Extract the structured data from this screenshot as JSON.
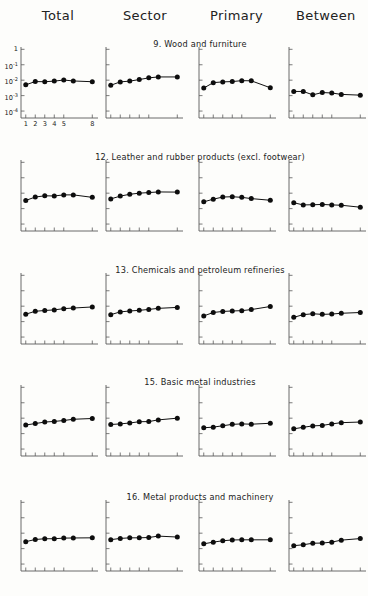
{
  "figure": {
    "background": "#fdfdfb",
    "ink": "#111111",
    "axis_color": "#5a5a5a",
    "columns": [
      {
        "label": "Total",
        "x": 58
      },
      {
        "label": "Sector",
        "x": 145
      },
      {
        "label": "Primary",
        "x": 236
      },
      {
        "label": "Between",
        "x": 322
      }
    ],
    "y_axis": {
      "label_top_to_bottom": [
        "1",
        "10<sup>-1</sup>",
        "10<sup>-2</sup>",
        "10<sup>-3</sup>",
        "10<sup>-4</sup>"
      ],
      "plain": [
        "1",
        "10-1",
        "10-2",
        "10-3",
        "10-4"
      ],
      "min_exp": -4.45,
      "max_exp": 0.15,
      "ticks_exp": [
        0,
        -1,
        -2,
        -3,
        -4
      ]
    },
    "x_axis": {
      "tick_labels": [
        "1",
        "2",
        "3",
        "4",
        "5",
        "8"
      ],
      "tick_positions": [
        1,
        2,
        3,
        4,
        5,
        8
      ],
      "x_min": 0.5,
      "x_max": 8.6,
      "n_points": 7,
      "point_x": [
        1,
        2,
        3,
        4,
        5,
        6,
        8
      ]
    }
  },
  "chart_data": {
    "type": "line",
    "title": "",
    "xlabel": "",
    "ylabel": "",
    "grid": false,
    "legend_position": "none",
    "x_ticks": [
      1,
      2,
      3,
      4,
      5,
      8
    ],
    "y_ticks_log10": [
      0,
      -1,
      -2,
      -3,
      -4
    ],
    "ylim_log10": [
      -4.45,
      0.15
    ],
    "xlim": [
      0.5,
      8.6
    ],
    "columns": [
      "Total",
      "Sector",
      "Primary",
      "Between"
    ],
    "x": [
      1,
      2,
      3,
      4,
      5,
      6,
      8
    ],
    "rows": [
      {
        "title": "9. Wood and furniture",
        "series": [
          {
            "name": "Total",
            "values_log10": [
              -2.3,
              -2.09,
              -2.1,
              -2.06,
              -1.99,
              -2.05,
              -2.1
            ]
          },
          {
            "name": "Sector",
            "values_log10": [
              -2.33,
              -2.11,
              -2.06,
              -1.96,
              -1.85,
              -1.79,
              -1.79
            ]
          },
          {
            "name": "Primary",
            "values_log10": [
              -2.51,
              -2.16,
              -2.11,
              -2.09,
              -2.03,
              -2.04,
              -2.49
            ]
          },
          {
            "name": "Between",
            "values_log10": [
              -2.73,
              -2.73,
              -2.95,
              -2.8,
              -2.83,
              -2.92,
              -2.97
            ]
          }
        ]
      },
      {
        "title": "12. Leather and rubber products (excl. footwear)",
        "series": [
          {
            "name": "Total",
            "values_log10": [
              -2.47,
              -2.25,
              -2.17,
              -2.18,
              -2.11,
              -2.11,
              -2.27
            ]
          },
          {
            "name": "Sector",
            "values_log10": [
              -2.37,
              -2.19,
              -2.07,
              -2.0,
              -1.96,
              -1.92,
              -1.93
            ]
          },
          {
            "name": "Primary",
            "values_log10": [
              -2.56,
              -2.39,
              -2.25,
              -2.23,
              -2.27,
              -2.35,
              -2.46
            ]
          },
          {
            "name": "Between",
            "values_log10": [
              -2.62,
              -2.76,
              -2.75,
              -2.73,
              -2.76,
              -2.78,
              -2.91
            ]
          }
        ]
      },
      {
        "title": "13. Chemicals and petroleum refineries",
        "series": [
          {
            "name": "Total",
            "values_log10": [
              -2.52,
              -2.33,
              -2.28,
              -2.24,
              -2.16,
              -2.12,
              -2.05
            ]
          },
          {
            "name": "Sector",
            "values_log10": [
              -2.55,
              -2.37,
              -2.31,
              -2.27,
              -2.21,
              -2.14,
              -2.08
            ]
          },
          {
            "name": "Primary",
            "values_log10": [
              -2.63,
              -2.41,
              -2.34,
              -2.31,
              -2.29,
              -2.22,
              -2.02
            ]
          },
          {
            "name": "Between",
            "values_log10": [
              -2.72,
              -2.55,
              -2.49,
              -2.53,
              -2.51,
              -2.46,
              -2.41
            ]
          }
        ]
      },
      {
        "title": "15. Basic metal industries",
        "series": [
          {
            "name": "Total",
            "values_log10": [
              -2.44,
              -2.35,
              -2.25,
              -2.21,
              -2.15,
              -2.07,
              -2.02
            ]
          },
          {
            "name": "Sector",
            "values_log10": [
              -2.41,
              -2.37,
              -2.31,
              -2.23,
              -2.22,
              -2.11,
              -2.0
            ]
          },
          {
            "name": "Primary",
            "values_log10": [
              -2.62,
              -2.58,
              -2.49,
              -2.4,
              -2.37,
              -2.39,
              -2.33
            ]
          },
          {
            "name": "Between",
            "values_log10": [
              -2.69,
              -2.59,
              -2.5,
              -2.47,
              -2.37,
              -2.29,
              -2.25
            ]
          }
        ]
      },
      {
        "title": "16. Metal products and machinery",
        "series": [
          {
            "name": "Total",
            "values_log10": [
              -2.55,
              -2.41,
              -2.36,
              -2.36,
              -2.32,
              -2.31,
              -2.3
            ]
          },
          {
            "name": "Sector",
            "values_log10": [
              -2.42,
              -2.34,
              -2.3,
              -2.3,
              -2.28,
              -2.19,
              -2.25
            ]
          },
          {
            "name": "Primary",
            "values_log10": [
              -2.69,
              -2.58,
              -2.49,
              -2.44,
              -2.43,
              -2.43,
              -2.43
            ]
          },
          {
            "name": "Between",
            "values_log10": [
              -2.81,
              -2.75,
              -2.65,
              -2.64,
              -2.58,
              -2.45,
              -2.35
            ]
          }
        ]
      }
    ]
  },
  "layout": {
    "panel_left": [
      20,
      105,
      198,
      288
    ],
    "panel_width": [
      78,
      78,
      78,
      78
    ],
    "row_top": [
      47,
      160,
      273,
      385,
      500
    ],
    "row_height": 71,
    "row_title_center_x": 200,
    "row_title_dy": -8,
    "header_y": 8
  }
}
